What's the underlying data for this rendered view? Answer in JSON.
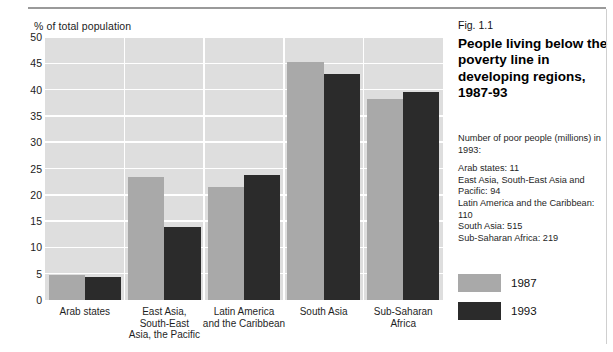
{
  "axis_title": "% of total population",
  "panel": {
    "fig_number": "Fig. 1.1",
    "headline": "People living below the poverty line in developing regions, 1987-93",
    "notes_intro": "Number of poor people (millions) in 1993:",
    "notes_items": [
      "Arab states: 11",
      "East Asia, South-East Asia and Pacific: 94",
      "Latin America and the Caribbean: 110",
      "South Asia: 515",
      "Sub-Saharan Africa: 219"
    ],
    "legend": [
      {
        "label": "1987",
        "color": "#a9a9a9"
      },
      {
        "label": "1993",
        "color": "#2b2b2b"
      }
    ]
  },
  "chart_data": {
    "type": "bar",
    "title": "People living below the poverty line in developing regions, 1987-93",
    "xlabel": "",
    "ylabel": "% of total population",
    "ylim": [
      0,
      50
    ],
    "yticks": [
      0,
      5,
      10,
      15,
      20,
      25,
      30,
      35,
      40,
      45,
      50
    ],
    "grid": true,
    "legend_position": "right",
    "categories": [
      "Arab states",
      "East Asia, South-East Asia, the Pacific",
      "Latin America and the Caribbean",
      "South Asia",
      "Sub-Saharan Africa"
    ],
    "category_lines": [
      [
        "Arab states"
      ],
      [
        "East Asia,",
        "South-East",
        "Asia, the Pacific"
      ],
      [
        "Latin America",
        "and the Caribbean"
      ],
      [
        "South Asia"
      ],
      [
        "Sub-Saharan",
        "Africa"
      ]
    ],
    "series": [
      {
        "name": "1987",
        "color": "#a9a9a9",
        "values": [
          4.8,
          23.3,
          21.5,
          45.2,
          38.3
        ]
      },
      {
        "name": "1993",
        "color": "#2b2b2b",
        "values": [
          4.4,
          13.8,
          23.7,
          43.0,
          39.5
        ]
      }
    ]
  }
}
